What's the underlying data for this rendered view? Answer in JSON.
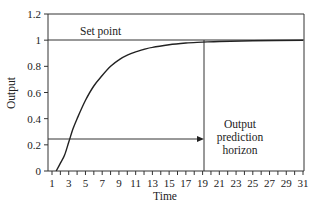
{
  "chart_data": {
    "type": "line",
    "title": "",
    "xlabel": "Time",
    "ylabel": "Output",
    "xlim": [
      1,
      31
    ],
    "ylim": [
      0,
      1.2
    ],
    "x_ticks": [
      1,
      3,
      5,
      7,
      9,
      11,
      13,
      15,
      17,
      19,
      21,
      23,
      25,
      27,
      29,
      31
    ],
    "y_ticks": [
      0,
      0.2,
      0.4,
      0.6,
      0.8,
      1,
      1.2
    ],
    "y_tick_labels": [
      "0",
      "0.2",
      "0.4",
      "0.6",
      "0.8",
      "1",
      "1.2"
    ],
    "grid": false,
    "series": [
      {
        "name": "Output response",
        "x": [
          1.5,
          2,
          2.5,
          3,
          3.5,
          4,
          5,
          6,
          7,
          8,
          9,
          10,
          11,
          12,
          13,
          15,
          17,
          19,
          21,
          25,
          31
        ],
        "y": [
          0,
          0.06,
          0.12,
          0.22,
          0.32,
          0.4,
          0.54,
          0.65,
          0.73,
          0.8,
          0.85,
          0.885,
          0.91,
          0.93,
          0.945,
          0.965,
          0.978,
          0.985,
          0.99,
          0.995,
          1.0
        ]
      }
    ],
    "reference_lines": [
      {
        "type": "horizontal",
        "y": 1,
        "label": "Set point"
      },
      {
        "type": "vertical",
        "x": 19.2,
        "label": "Output prediction horizon"
      },
      {
        "type": "arrow",
        "from_x": 1,
        "to_x": 19.2,
        "y": 0.245
      }
    ],
    "annotations": [
      {
        "text": "Set point",
        "x": 5,
        "y": 1.03
      },
      {
        "text": "Output\nprediction\nhorizon",
        "x": 24,
        "y": 0.2
      }
    ]
  },
  "labels": {
    "setpoint": "Set point",
    "horizon_line1": "Output",
    "horizon_line2": "prediction",
    "horizon_line3": "horizon",
    "xlabel": "Time",
    "ylabel": "Output"
  },
  "ticks": {
    "y": [
      "0",
      "0.2",
      "0.4",
      "0.6",
      "0.8",
      "1",
      "1.2"
    ],
    "x": [
      "1",
      "3",
      "5",
      "7",
      "9",
      "11",
      "13",
      "15",
      "17",
      "19",
      "21",
      "23",
      "25",
      "27",
      "29",
      "31"
    ]
  }
}
